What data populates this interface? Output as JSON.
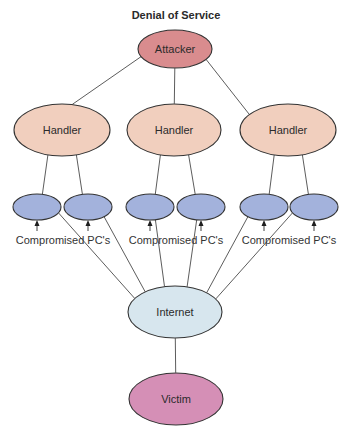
{
  "title": "Denial of Service",
  "colors": {
    "attacker": "#d98c8e",
    "handler": "#f1cfbe",
    "pc": "#a3b2dc",
    "internet": "#d7e6ee",
    "victim": "#d58fb6",
    "edge": "#4a4a4a"
  },
  "nodes": {
    "attacker": {
      "label": "Attacker"
    },
    "handlers": [
      {
        "label": "Handler"
      },
      {
        "label": "Handler"
      },
      {
        "label": "Handler"
      }
    ],
    "pc_groups": [
      {
        "caption": "Compromised PC's",
        "pc_count": 2
      },
      {
        "caption": "Compromised PC's",
        "pc_count": 2
      },
      {
        "caption": "Compromised PC's",
        "pc_count": 2
      }
    ],
    "internet": {
      "label": "Internet"
    },
    "victim": {
      "label": "Victim"
    }
  },
  "edges": [
    {
      "from": "attacker",
      "to": "handler-1"
    },
    {
      "from": "attacker",
      "to": "handler-2"
    },
    {
      "from": "attacker",
      "to": "handler-3"
    },
    {
      "from": "handler-1",
      "to": "pc-1"
    },
    {
      "from": "handler-1",
      "to": "pc-2"
    },
    {
      "from": "handler-2",
      "to": "pc-3"
    },
    {
      "from": "handler-2",
      "to": "pc-4"
    },
    {
      "from": "handler-3",
      "to": "pc-5"
    },
    {
      "from": "handler-3",
      "to": "pc-6"
    },
    {
      "from": "pc-1",
      "to": "internet"
    },
    {
      "from": "pc-2",
      "to": "internet"
    },
    {
      "from": "pc-3",
      "to": "internet"
    },
    {
      "from": "pc-4",
      "to": "internet"
    },
    {
      "from": "pc-5",
      "to": "internet"
    },
    {
      "from": "pc-6",
      "to": "internet"
    },
    {
      "from": "internet",
      "to": "victim"
    }
  ]
}
